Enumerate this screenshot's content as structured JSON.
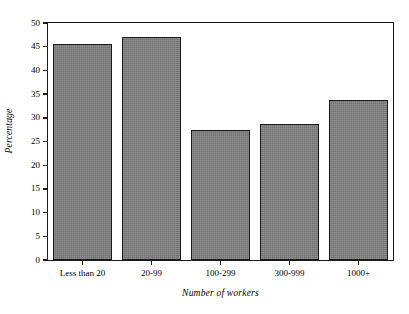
{
  "chart_data": {
    "type": "bar",
    "title": "",
    "xlabel": "Number of workers",
    "ylabel": "Percentage",
    "categories": [
      "Less than 20",
      "20-99",
      "100-299",
      "300-999",
      "1000+"
    ],
    "values": [
      45.5,
      47.0,
      27.5,
      28.7,
      33.8
    ],
    "ylim": [
      0,
      50
    ],
    "yticks": [
      0,
      5,
      10,
      15,
      20,
      25,
      30,
      35,
      40,
      45,
      50
    ],
    "ytick_labels": [
      "0",
      "5",
      "10",
      "15",
      "20",
      "25",
      "30",
      "35",
      "40",
      "45",
      "50"
    ],
    "grid": false,
    "legend": null,
    "bar_color": "#808080",
    "bar_edge_color": "#1a1a1a",
    "frame_color": "#1a1a1a",
    "background": "#ffffff"
  }
}
